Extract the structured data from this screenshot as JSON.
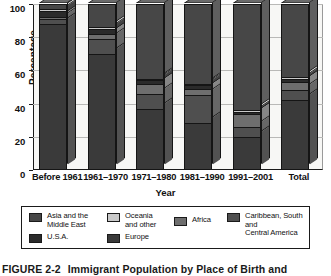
{
  "chart_data": {
    "type": "bar",
    "subtype": "stacked-3d-column",
    "title": "Immigrant Population by Place of Birth and",
    "figure_number": "FIGURE 2-2",
    "xlabel": "Year",
    "ylabel": "Percentage",
    "ylim": [
      0,
      100
    ],
    "yticks": [
      0,
      20,
      40,
      60,
      80,
      100
    ],
    "grid": true,
    "legend_position": "bottom",
    "categories": [
      "Before 1961",
      "1961–1970",
      "1971–1980",
      "1981–1990",
      "1991–2001",
      "Total"
    ],
    "series": [
      {
        "name": "Europe",
        "color": "#3a3a3a",
        "values": [
          88,
          70,
          37,
          28,
          20,
          42
        ]
      },
      {
        "name": "Caribbean, South and Central America",
        "color": "#4f4f4f",
        "values": [
          3,
          9,
          9,
          17,
          6,
          6
        ]
      },
      {
        "name": "Africa",
        "color": "#6e6e6e",
        "values": [
          1,
          3,
          6,
          4,
          8,
          5
        ]
      },
      {
        "name": "U.S.A.",
        "color": "#2b2b2b",
        "values": [
          4,
          3,
          2,
          2,
          1,
          2
        ]
      },
      {
        "name": "Oceania and other",
        "color": "#c9c9c9",
        "values": [
          1,
          1,
          1,
          1,
          1,
          1
        ]
      },
      {
        "name": "Asia and the Middle East",
        "color": "#474747",
        "values": [
          3,
          14,
          45,
          48,
          64,
          44
        ]
      }
    ]
  },
  "axes": {
    "y_title": "Percentage",
    "x_title": "Year",
    "y_ticks": [
      "100",
      "80",
      "60",
      "40",
      "20",
      "0"
    ]
  },
  "legend": {
    "entries": [
      {
        "label": "Asia and the\nMiddle East",
        "color": "#474747",
        "icon": "legend-swatch-asia"
      },
      {
        "label": "Oceania\nand other",
        "color": "#c9c9c9",
        "icon": "legend-swatch-oceania"
      },
      {
        "label": "Africa",
        "color": "#6e6e6e",
        "icon": "legend-swatch-africa"
      },
      {
        "label": "Caribbean, South and\nCentral America",
        "color": "#4f4f4f",
        "icon": "legend-swatch-caribbean"
      },
      {
        "label": "U.S.A.",
        "color": "#2b2b2b",
        "icon": "legend-swatch-usa"
      },
      {
        "label": "Europe",
        "color": "#3a3a3a",
        "icon": "legend-swatch-europe"
      }
    ]
  },
  "caption": {
    "figure_number": "FIGURE 2-2",
    "text": "Immigrant Population by Place of Birth and"
  },
  "colors": {
    "axis": "#1a1a1a",
    "grid": "#b9b9b7",
    "plot_background": "#f7f7f5",
    "page_background": "#ffffff"
  }
}
